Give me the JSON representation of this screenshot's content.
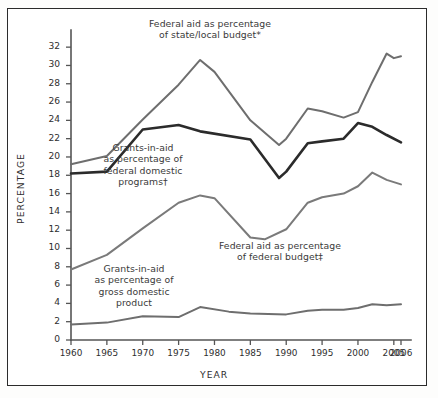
{
  "chart_data": {
    "type": "line",
    "title": "",
    "xlabel": "YEAR",
    "ylabel": "PERCENTAGE",
    "xlim": [
      1960,
      2006
    ],
    "ylim": [
      0,
      33
    ],
    "grid": false,
    "legend_position": "inline-annotations",
    "y_ticks": [
      0,
      2,
      4,
      6,
      8,
      10,
      12,
      14,
      16,
      18,
      20,
      22,
      24,
      26,
      28,
      30,
      32
    ],
    "x_ticks": [
      1960,
      1965,
      1970,
      1975,
      1980,
      1985,
      1990,
      1995,
      2000,
      2005,
      2006
    ],
    "series": [
      {
        "name": "Federal aid as percentage of state/local budget*",
        "color": "#6e6e6e",
        "x": [
          1960,
          1965,
          1970,
          1975,
          1978,
          1980,
          1985,
          1989,
          1990,
          1993,
          1995,
          1998,
          2000,
          2002,
          2004,
          2005,
          2006
        ],
        "values": [
          19.2,
          20.1,
          24.1,
          27.9,
          30.6,
          29.3,
          24.0,
          21.3,
          22.0,
          25.3,
          25.0,
          24.3,
          24.9,
          28.2,
          31.3,
          30.8,
          31.0
        ]
      },
      {
        "name": "Grants-in-aid as percentage of federal domestic programs†",
        "color": "#2b2b2b",
        "x": [
          1960,
          1965,
          1970,
          1975,
          1978,
          1985,
          1989,
          1990,
          1993,
          1995,
          1998,
          2000,
          2002,
          2004,
          2006
        ],
        "values": [
          18.2,
          18.4,
          23.0,
          23.5,
          22.8,
          21.9,
          17.7,
          18.4,
          21.5,
          21.7,
          22.0,
          23.7,
          23.3,
          22.4,
          21.6
        ]
      },
      {
        "name": "Federal aid as percentage of federal budget‡",
        "color": "#7a7a7a",
        "x": [
          1960,
          1965,
          1970,
          1975,
          1978,
          1980,
          1985,
          1987,
          1990,
          1993,
          1995,
          1998,
          2000,
          2002,
          2004,
          2006
        ],
        "values": [
          7.7,
          9.3,
          12.2,
          15.0,
          15.8,
          15.5,
          11.2,
          11.0,
          12.1,
          15.0,
          15.6,
          16.0,
          16.8,
          18.3,
          17.5,
          17.0
        ]
      },
      {
        "name": "Grants-in-aid as percentage of gross domestic product",
        "color": "#6e6e6e",
        "x": [
          1960,
          1965,
          1970,
          1975,
          1978,
          1982,
          1985,
          1990,
          1993,
          1995,
          1998,
          2000,
          2002,
          2004,
          2006
        ],
        "values": [
          1.7,
          1.9,
          2.6,
          2.5,
          3.6,
          3.1,
          2.9,
          2.8,
          3.2,
          3.3,
          3.3,
          3.5,
          3.9,
          3.8,
          3.9
        ]
      }
    ],
    "annotations": [
      {
        "id": "annotation-state-local",
        "lines": [
          "Federal aid as percentage",
          "of state/local budget*"
        ],
        "x_px": 210,
        "y_px": 18
      },
      {
        "id": "annotation-federal-domestic",
        "lines": [
          "Grants-in-aid",
          "as percentage of",
          "federal domestic",
          "programs†"
        ],
        "x_px": 143,
        "y_px": 142
      },
      {
        "id": "annotation-federal-budget",
        "lines": [
          "Federal aid as percentage",
          "of federal budget‡"
        ],
        "x_px": 280,
        "y_px": 240
      },
      {
        "id": "annotation-gdp",
        "lines": [
          "Grants-in-aid",
          "as percentage of",
          "gross domestic",
          "product"
        ],
        "x_px": 134,
        "y_px": 263
      }
    ]
  }
}
